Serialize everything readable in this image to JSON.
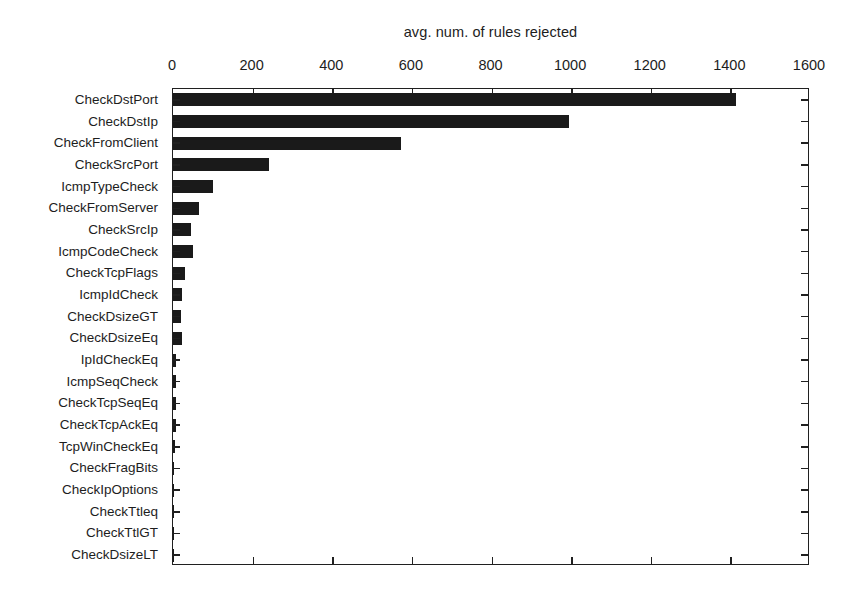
{
  "chart_data": {
    "type": "bar",
    "orientation": "horizontal",
    "title": "avg. num. of rules rejected",
    "xlabel": "",
    "ylabel": "",
    "xlim": [
      0,
      1600
    ],
    "xticks": [
      0,
      200,
      400,
      600,
      800,
      1000,
      1200,
      1400,
      1600
    ],
    "xtick_labels": [
      "0",
      "200",
      "400",
      "600",
      "800",
      "1000",
      "1200",
      "1400",
      "1600"
    ],
    "grid": false,
    "legend": null,
    "bar_color": "#1a1a1a",
    "categories": [
      "CheckDstPort",
      "CheckDstIp",
      "CheckFromClient",
      "CheckSrcPort",
      "IcmpTypeCheck",
      "CheckFromServer",
      "CheckSrcIp",
      "IcmpCodeCheck",
      "CheckTcpFlags",
      "IcmpIdCheck",
      "CheckDsizeGT",
      "CheckDsizeEq",
      "IpIdCheckEq",
      "IcmpSeqCheck",
      "CheckTcpSeqEq",
      "CheckTcpAckEq",
      "TcpWinCheckEq",
      "CheckFragBits",
      "CheckIpOptions",
      "CheckTtleq",
      "CheckTtlGT",
      "CheckDsizeLT"
    ],
    "values": [
      1415,
      995,
      573,
      240,
      100,
      66,
      46,
      50,
      30,
      22,
      20,
      22,
      8,
      8,
      8,
      8,
      4,
      2,
      2,
      2,
      2,
      2
    ]
  }
}
